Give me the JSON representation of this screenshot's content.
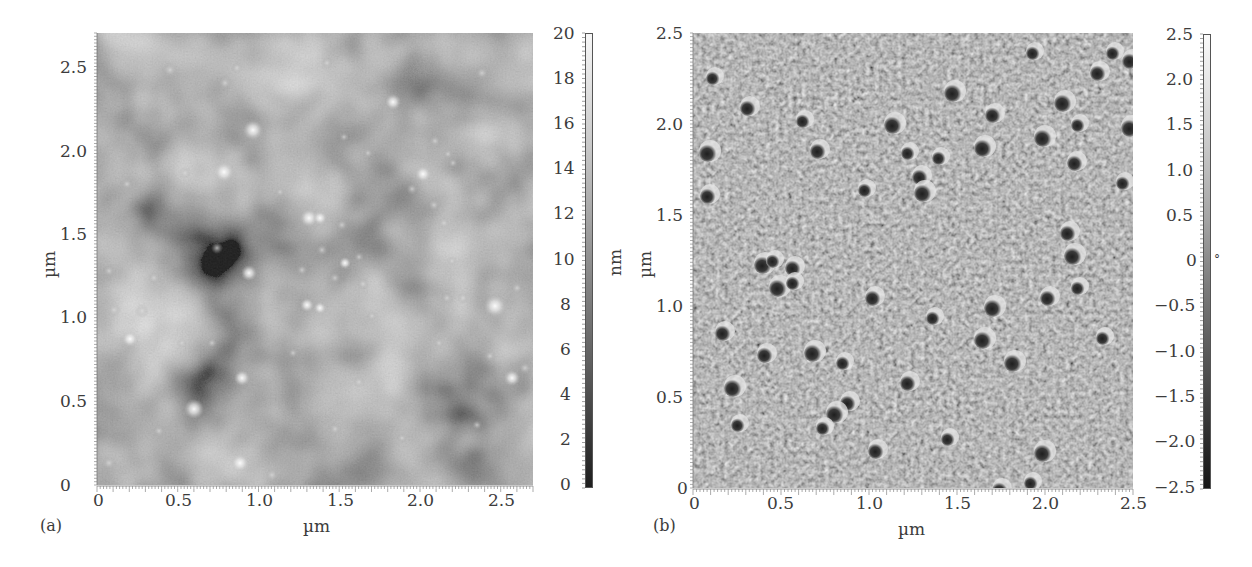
{
  "chart_data": [
    {
      "type": "heatmap",
      "panel_label": "(a)",
      "title": "AFM height image",
      "xlabel": "µm",
      "ylabel": "µm",
      "xlim": [
        0,
        2.7
      ],
      "ylim": [
        0,
        2.7
      ],
      "x_ticks": [
        "0",
        "0.5",
        "1.0",
        "1.5",
        "2.0",
        "2.5"
      ],
      "y_ticks": [
        "0",
        "0.5",
        "1.0",
        "1.5",
        "2.0",
        "2.5"
      ],
      "colorbar": {
        "label": "nm",
        "range": [
          0,
          20
        ],
        "ticks": [
          "0",
          "2",
          "4",
          "6",
          "8",
          "10",
          "12",
          "14",
          "16",
          "18",
          "20"
        ],
        "colormap": "grayscale (dark=low, white=high)"
      },
      "description": "Height map showing bright round particles scattered on a darker mottled background"
    },
    {
      "type": "heatmap",
      "panel_label": "(b)",
      "title": "AFM phase image",
      "xlabel": "µm",
      "ylabel": "µm",
      "xlim": [
        0,
        2.5
      ],
      "ylim": [
        0,
        2.5
      ],
      "x_ticks": [
        "0",
        "0.5",
        "1.0",
        "1.5",
        "2.0",
        "2.5"
      ],
      "y_ticks": [
        "0",
        "0.5",
        "1.0",
        "1.5",
        "2.0",
        "2.5"
      ],
      "colorbar": {
        "label": "°",
        "range": [
          -2.5,
          2.5
        ],
        "ticks": [
          "−2.5",
          "−2.0",
          "−1.5",
          "−1.0",
          "−0.5",
          "0",
          "0.5",
          "1.0",
          "1.5",
          "2.0",
          "2.5"
        ],
        "colormap": "grayscale (dark=low, white=high)"
      },
      "description": "Phase map with granular texture and dark round particles with bright rims"
    }
  ],
  "panels": {
    "a": {
      "label": "(a)",
      "xlabel": "µm",
      "ylabel": "µm",
      "x_ticks": [
        "0",
        "0.5",
        "1.0",
        "1.5",
        "2.0",
        "2.5"
      ],
      "y_ticks": [
        "0",
        "0.5",
        "1.0",
        "1.5",
        "2.0",
        "2.5"
      ],
      "cbar_label": "nm",
      "cbar_ticks": [
        "20",
        "18",
        "16",
        "14",
        "12",
        "10",
        "8",
        "6",
        "4",
        "2",
        "0"
      ]
    },
    "b": {
      "label": "(b)",
      "xlabel": "µm",
      "ylabel": "µm",
      "x_ticks": [
        "0",
        "0.5",
        "1.0",
        "1.5",
        "2.0",
        "2.5"
      ],
      "y_ticks": [
        "0",
        "0.5",
        "1.0",
        "1.5",
        "2.0",
        "2.5"
      ],
      "cbar_label": "°",
      "cbar_ticks": [
        "2.5",
        "2.0",
        "1.5",
        "1.0",
        "0.5",
        "0",
        "−0.5",
        "−1.0",
        "−1.5",
        "−2.0",
        "−2.5"
      ]
    }
  }
}
